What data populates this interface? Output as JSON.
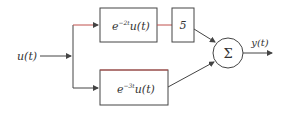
{
  "diagram": {
    "input_label": "u(t)",
    "output_label": "y(t)",
    "top_block": {
      "base": "e",
      "exponent": "−2t",
      "rest": "u(t)"
    },
    "gain_block": {
      "label": "5"
    },
    "bottom_block": {
      "base": "e",
      "exponent": "−3t",
      "rest": "u(t)"
    },
    "summer": {
      "symbol": "Σ"
    }
  },
  "colors": {
    "line": "#444444",
    "accent": "#c0504d"
  }
}
